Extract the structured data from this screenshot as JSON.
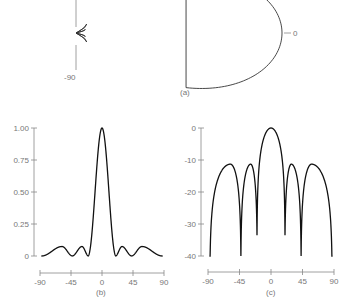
{
  "chart_data": [
    {
      "panel": "a",
      "type": "line",
      "title": "",
      "caption": "(a)",
      "description": "Polar radiation pattern (narrow main lobe along 0 degrees)",
      "axis_labels": {
        "zero": "0",
        "minus90": "-90"
      },
      "main_lobe_direction_deg": 0,
      "beamwidth_deg": 10
    },
    {
      "panel": "b",
      "type": "line",
      "caption": "(b)",
      "xlabel": "",
      "ylabel": "",
      "xlim": [
        -90,
        90
      ],
      "ylim": [
        0,
        1.0
      ],
      "xticks": [
        -90,
        -45,
        0,
        45,
        90
      ],
      "xtick_labels": [
        "-90",
        "-45",
        "0",
        "45",
        "90"
      ],
      "yticks": [
        0,
        0.25,
        0.5,
        0.75,
        1.0
      ],
      "ytick_labels": [
        "0",
        "0.25",
        "0.50",
        "0.75",
        "1.00"
      ],
      "scale": "linear power (10^(dB/10))"
    },
    {
      "panel": "c",
      "type": "line",
      "caption": "(c)",
      "xlabel": "",
      "ylabel": "",
      "xlim": [
        -90,
        90
      ],
      "ylim": [
        -40,
        0
      ],
      "xticks": [
        -90,
        -45,
        0,
        45,
        90
      ],
      "xtick_labels": [
        "-90",
        "-45",
        "0",
        "45",
        "90"
      ],
      "yticks": [
        0,
        -10,
        -20,
        -30,
        -40
      ],
      "ytick_labels": [
        "0",
        "-10",
        "-20",
        "-30",
        "-40"
      ],
      "scale": "dB, clipped at -40",
      "lobes": [
        {
          "start": -90,
          "end": -87,
          "peak_db": -40,
          "peak_at": -88.5,
          "floor": true
        },
        {
          "start": -87,
          "end": -43,
          "peak_db": -11.3,
          "peak_at": -58
        },
        {
          "start": -43,
          "end": -20,
          "peak_db": -11.3,
          "peak_at": -29
        },
        {
          "start": -20,
          "end": 20,
          "peak_db": 0,
          "peak_at": 0
        },
        {
          "start": 20,
          "end": 43,
          "peak_db": -11.3,
          "peak_at": 29
        },
        {
          "start": 43,
          "end": 87,
          "peak_db": -11.3,
          "peak_at": 58
        },
        {
          "start": 87,
          "end": 90,
          "peak_db": -40,
          "peak_at": 88.5,
          "floor": true
        }
      ],
      "null_depths_db": {
        "-43": -40,
        "-20": -33.5,
        "20": -33.5,
        "43": -40
      }
    }
  ]
}
